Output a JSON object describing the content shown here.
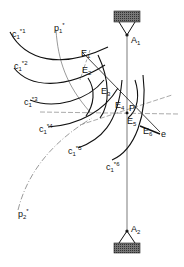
{
  "figure": {
    "supports": {
      "top": {
        "label": "A",
        "sub": "1"
      },
      "bottom": {
        "label": "A",
        "sub": "2"
      }
    },
    "curves": [
      {
        "label": "c",
        "sub": "1",
        "sup": "*1"
      },
      {
        "label": "c",
        "sub": "1",
        "sup": "*2"
      },
      {
        "label": "c",
        "sub": "1",
        "sup": "*3"
      },
      {
        "label": "c",
        "sub": "1",
        "sup": "*4"
      },
      {
        "label": "c",
        "sub": "1",
        "sup": "*5"
      },
      {
        "label": "c",
        "sub": "1",
        "sup": "*6"
      }
    ],
    "dashed_curves": [
      {
        "label": "p",
        "sub": "1",
        "sup": "*"
      },
      {
        "label": "p",
        "sub": "2",
        "sup": "*"
      }
    ],
    "points": [
      {
        "label": "E",
        "sub": "1"
      },
      {
        "label": "E",
        "sub": "2"
      },
      {
        "label": "E",
        "sub": "3"
      },
      {
        "label": "E",
        "sub": "4"
      },
      {
        "label": "E",
        "sub": "5"
      },
      {
        "label": "E",
        "sub": "6"
      }
    ],
    "pole": {
      "label": "P"
    },
    "line": {
      "label": "e"
    },
    "colors": {
      "ink": "#111111",
      "hatch": "#555555",
      "background": "#ffffff"
    }
  }
}
